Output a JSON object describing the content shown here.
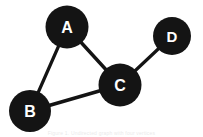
{
  "figure": {
    "caption": "Figure 1. Undirected graph with four vertices",
    "background_color": "#ffffff",
    "node_color": "#141414",
    "node_label_color": "#ffffff",
    "edge_color": "#141414"
  },
  "graph": {
    "nodes": [
      {
        "id": "A",
        "label": "A",
        "cx": 67,
        "cy": 27,
        "r": 21.5,
        "font_size": 16
      },
      {
        "id": "B",
        "label": "B",
        "cx": 30,
        "cy": 111,
        "r": 21,
        "font_size": 16
      },
      {
        "id": "C",
        "label": "C",
        "cx": 120,
        "cy": 85,
        "r": 21.5,
        "font_size": 16
      },
      {
        "id": "D",
        "label": "D",
        "cx": 172,
        "cy": 36,
        "r": 19,
        "font_size": 15
      }
    ],
    "edges": [
      {
        "id": "A-B",
        "from": "A",
        "to": "B",
        "width": 3.2
      },
      {
        "id": "A-C",
        "from": "A",
        "to": "C",
        "width": 3.4
      },
      {
        "id": "B-C",
        "from": "B",
        "to": "C",
        "width": 3.6
      },
      {
        "id": "C-D",
        "from": "C",
        "to": "D",
        "width": 3.2
      }
    ]
  }
}
